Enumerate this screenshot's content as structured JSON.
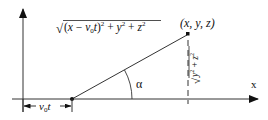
{
  "diagram": {
    "point_label": "(x, y, z)",
    "distance_label": {
      "radical": "√",
      "open": "(",
      "x": "x",
      "minus": " − ",
      "v": "v",
      "v_sub": "0",
      "t": "t",
      "close": ")",
      "sq1": "2",
      "plus1": " + ",
      "y": "y",
      "sq2": "2",
      "plus2": " + ",
      "z": "z",
      "sq3": "2"
    },
    "perp_label": {
      "radical": "√",
      "y": "y",
      "sq1": "2",
      "plus": " + ",
      "z": "z",
      "sq2": "2"
    },
    "angle_label": "α",
    "x_axis_label": "x",
    "offset_label": {
      "v": "v",
      "v_sub": "0",
      "t": "t"
    },
    "colors": {
      "line": "#222222",
      "background": "#ffffff"
    }
  }
}
